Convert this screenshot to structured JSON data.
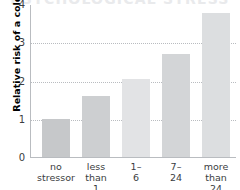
{
  "chart_data": {
    "type": "bar",
    "title": "PSYCHOLOGICAL STRESS",
    "xlabel": "",
    "ylabel": "Relative risk of a cold",
    "categories": [
      "no\nstressor",
      "less\nthan 1",
      "1–6",
      "7–24",
      "more\nthan 24"
    ],
    "values": [
      1.0,
      1.6,
      2.05,
      2.7,
      3.77
    ],
    "bar_colors": [
      "#c6c8ca",
      "#cdcfd1",
      "#e2e3e5",
      "#d3d5d7",
      "#dcdee0"
    ],
    "ylim": [
      0,
      4
    ],
    "yticks": [
      "0",
      "1",
      "2",
      "3",
      "4"
    ],
    "ytick_values": [
      0,
      1,
      2,
      3,
      4
    ],
    "grid": "horizontal-dotted",
    "gridline_values": [
      1,
      2,
      3
    ],
    "legend": "none"
  },
  "axis_color": "#b9bcc0",
  "text_color": "#3a3d41"
}
